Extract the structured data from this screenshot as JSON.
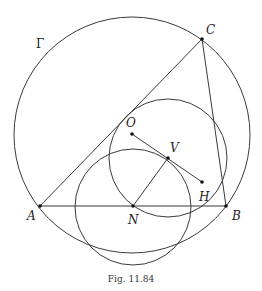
{
  "figure": {
    "caption": "Fig. 11.84",
    "circle_label": "Γ",
    "points": {
      "A": {
        "label": "A",
        "x": 40,
        "y": 206
      },
      "B": {
        "label": "B",
        "x": 226,
        "y": 206
      },
      "C": {
        "label": "C",
        "x": 202,
        "y": 39
      },
      "O": {
        "label": "O",
        "x": 132,
        "y": 134
      },
      "V": {
        "label": "V",
        "x": 168,
        "y": 158
      },
      "H": {
        "label": "H",
        "x": 202,
        "y": 182
      },
      "N": {
        "label": "N",
        "x": 133,
        "y": 206
      }
    },
    "circles": [
      {
        "name": "circumcircle-gamma",
        "cx": 132,
        "cy": 135,
        "r": 118
      },
      {
        "name": "circle-centered-v",
        "cx": 168,
        "cy": 158,
        "r": 59
      },
      {
        "name": "circle-centered-n",
        "cx": 133,
        "cy": 207,
        "r": 58
      }
    ],
    "segments": [
      "AB",
      "BC",
      "CA",
      "OH",
      "NV"
    ],
    "colors": {
      "stroke": "#3a3a3a",
      "background": "#ffffff"
    }
  }
}
